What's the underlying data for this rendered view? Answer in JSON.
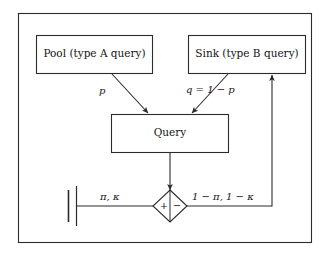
{
  "diagram": {
    "background": "#ffffff",
    "stroke": "#2b2b2b",
    "nodes": {
      "pool": {
        "label": "Pool (type A query)"
      },
      "sink": {
        "label": "Sink (type B query)"
      },
      "query": {
        "label": "Query"
      },
      "junction": {
        "plus": "+",
        "minus": "−"
      },
      "source_terminal": {
        "label": ""
      }
    },
    "edges": {
      "pool_to_query": {
        "label": "p"
      },
      "sink_to_query": {
        "label": "q = 1 − p"
      },
      "query_to_junction": {
        "label": ""
      },
      "source_to_junction": {
        "label": "π, κ"
      },
      "junction_to_sink": {
        "label": "1 − π, 1 − κ"
      }
    }
  }
}
